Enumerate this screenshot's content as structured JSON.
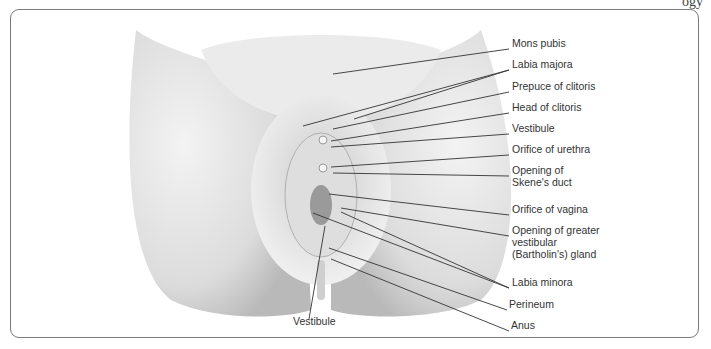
{
  "header": {
    "fragment": "ogy"
  },
  "figure": {
    "labels": [
      {
        "id": "mons-pubis",
        "text": "Mons pubis",
        "x": 511,
        "y": 42
      },
      {
        "id": "labia-majora",
        "text": "Labia majora",
        "x": 511,
        "y": 63
      },
      {
        "id": "prepuce-of-clitoris",
        "text": "Prepuce of clitoris",
        "x": 511,
        "y": 85
      },
      {
        "id": "head-of-clitoris",
        "text": "Head of clitoris",
        "x": 511,
        "y": 106
      },
      {
        "id": "vestibule-right",
        "text": "Vestibule",
        "x": 511,
        "y": 127
      },
      {
        "id": "orifice-of-urethra",
        "text": "Orifice of urethra",
        "x": 511,
        "y": 148
      },
      {
        "id": "opening-of-skenes-duct",
        "lines": [
          "Opening of",
          "Skene's duct"
        ],
        "x": 511,
        "y": 169
      },
      {
        "id": "orifice-of-vagina",
        "text": "Orifice of vagina",
        "x": 511,
        "y": 208
      },
      {
        "id": "opening-of-bartholins-gland",
        "lines": [
          "Opening of greater",
          "vestibular",
          "(Bartholin's) gland"
        ],
        "x": 511,
        "y": 229
      },
      {
        "id": "labia-minora",
        "text": "Labia minora",
        "x": 511,
        "y": 281
      },
      {
        "id": "perineum",
        "text": "Perineum",
        "x": 508,
        "y": 303
      },
      {
        "id": "anus",
        "text": "Anus",
        "x": 510,
        "y": 324
      },
      {
        "id": "vestibule-bottom",
        "text": "Vestibule",
        "x": 292,
        "y": 320
      }
    ],
    "leader_lines": [
      {
        "x1": 332,
        "y1": 73,
        "x2": 508,
        "y2": 48
      },
      {
        "x1": 302,
        "y1": 125,
        "x2": 508,
        "y2": 69
      },
      {
        "x1": 353,
        "y1": 118,
        "x2": 508,
        "y2": 69
      },
      {
        "x1": 332,
        "y1": 128,
        "x2": 508,
        "y2": 91
      },
      {
        "x1": 330,
        "y1": 140,
        "x2": 508,
        "y2": 112
      },
      {
        "x1": 330,
        "y1": 146,
        "x2": 508,
        "y2": 133
      },
      {
        "x1": 330,
        "y1": 166,
        "x2": 508,
        "y2": 154
      },
      {
        "x1": 332,
        "y1": 172,
        "x2": 508,
        "y2": 175
      },
      {
        "x1": 328,
        "y1": 193,
        "x2": 508,
        "y2": 214
      },
      {
        "x1": 340,
        "y1": 207,
        "x2": 508,
        "y2": 235
      },
      {
        "x1": 340,
        "y1": 211,
        "x2": 508,
        "y2": 287
      },
      {
        "x1": 312,
        "y1": 212,
        "x2": 508,
        "y2": 287
      },
      {
        "x1": 328,
        "y1": 247,
        "x2": 506,
        "y2": 309
      },
      {
        "x1": 330,
        "y1": 258,
        "x2": 508,
        "y2": 330
      },
      {
        "x1": 324,
        "y1": 225,
        "x2": 308,
        "y2": 318
      }
    ]
  },
  "colors": {
    "frame": "#7a7a7a",
    "leader": "#333333",
    "skin_light": "#f1f1f1",
    "skin_mid": "#d6d6d6",
    "skin_dark": "#a9a9a9"
  }
}
